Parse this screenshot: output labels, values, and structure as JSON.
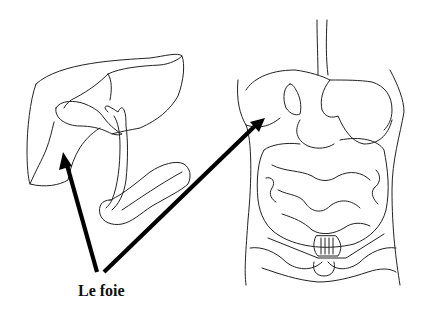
{
  "diagram": {
    "label": "Le foie",
    "left_figure": "isolated liver with gallbladder, bile ducts and pancreas",
    "right_figure": "human torso with digestive organs",
    "arrows": [
      {
        "from": [
          97,
          272
        ],
        "to": [
          63,
          152
        ],
        "target": "liver (isolated view)"
      },
      {
        "from": [
          104,
          272
        ],
        "to": [
          265,
          118
        ],
        "target": "liver (in torso)"
      }
    ],
    "colors": {
      "line": "#222222",
      "arrow": "#000000",
      "background": "#ffffff"
    }
  }
}
